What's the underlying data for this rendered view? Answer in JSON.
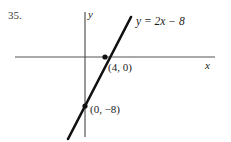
{
  "figure": {
    "problem_number": "35.",
    "width": 231,
    "height": 142,
    "background_color": "#ffffff",
    "ink_color": "#1a1a1a"
  },
  "axes": {
    "x_label": "x",
    "y_label": "y",
    "x_axis": {
      "x1": 15,
      "y1": 57,
      "x2": 215,
      "y2": 57,
      "color": "#555555"
    },
    "y_axis": {
      "x1": 85,
      "y1": 12,
      "x2": 85,
      "y2": 137,
      "color": "#555555"
    }
  },
  "line": {
    "equation": "y = 2x − 8",
    "equation_lhs": "y",
    "equation_rel": " = ",
    "equation_slope": "2",
    "equation_var": "x",
    "equation_const": " − 8",
    "slope": 2,
    "y_intercept": -8,
    "x_intercept": 4,
    "color": "#111111",
    "stroke_width": 2.6,
    "endpoints": {
      "x1": 68,
      "y1": 139,
      "x2": 131,
      "y2": 17
    }
  },
  "points": [
    {
      "name": "x-intercept",
      "label": "(4, 0)",
      "coords": [
        4,
        0
      ],
      "px": 105,
      "py": 57
    },
    {
      "name": "y-intercept",
      "label": "(0, −8)",
      "coords": [
        0,
        -8
      ],
      "px": 85,
      "py": 106
    }
  ],
  "chart_data": {
    "type": "line",
    "title": "",
    "xlabel": "x",
    "ylabel": "y",
    "series": [
      {
        "name": "y = 2x − 8",
        "slope": 2,
        "intercept": -8,
        "points": [
          [
            0,
            -8
          ],
          [
            4,
            0
          ]
        ]
      }
    ],
    "annotations": [
      "(4, 0)",
      "(0, −8)",
      "y = 2x − 8"
    ],
    "grid": false,
    "legend": "none"
  }
}
